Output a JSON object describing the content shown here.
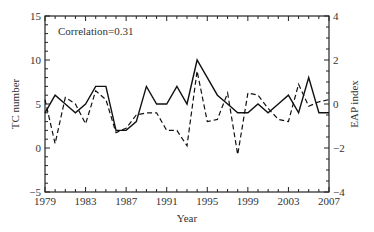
{
  "chart_data": {
    "type": "line",
    "title": "",
    "annotation": "Correlation=0.31",
    "xlabel": "Year",
    "ylabel_left": "TC number",
    "ylabel_right": "EAP index",
    "xlim": [
      1979,
      2007
    ],
    "ylim_left": [
      -5,
      15
    ],
    "ylim_right": [
      -4,
      4
    ],
    "x_ticks": [
      "1979",
      "1983",
      "1987",
      "1991",
      "1995",
      "1999",
      "2003",
      "2007"
    ],
    "y_ticks_left": [
      "-5",
      "0",
      "5",
      "10",
      "15"
    ],
    "y_ticks_right": [
      "-4",
      "-2",
      "0",
      "2",
      "4"
    ],
    "grid": false,
    "legend": "none",
    "x": [
      1979,
      1980,
      1981,
      1982,
      1983,
      1984,
      1985,
      1986,
      1987,
      1988,
      1989,
      1990,
      1991,
      1992,
      1993,
      1994,
      1995,
      1996,
      1997,
      1998,
      1999,
      2000,
      2001,
      2002,
      2003,
      2004,
      2005,
      2006,
      2007
    ],
    "series": [
      {
        "name": "TC number",
        "axis": "left",
        "style": "solid",
        "values": [
          4,
          6,
          5,
          4,
          5,
          7,
          7,
          2,
          2,
          3,
          7,
          5,
          5,
          7,
          5,
          10,
          8,
          6,
          5,
          4,
          4,
          5,
          4,
          5,
          6,
          4,
          8,
          4,
          4
        ]
      },
      {
        "name": "EAP index",
        "axis": "right",
        "style": "dashed",
        "values": [
          0.2,
          -1.8,
          0.3,
          0,
          -0.9,
          0.6,
          0.2,
          -1.3,
          -1.1,
          -0.5,
          -0.4,
          -0.4,
          -1.2,
          -1.2,
          -1.9,
          1.5,
          -0.8,
          -0.7,
          0.5,
          -2.3,
          0.5,
          0.4,
          -0.2,
          -0.7,
          -0.8,
          0.9,
          -0.1,
          0.1,
          0.2
        ]
      }
    ]
  }
}
